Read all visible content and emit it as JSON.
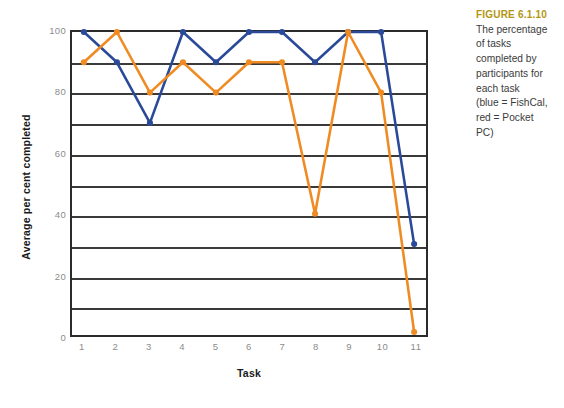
{
  "chart_data": {
    "type": "line",
    "title": "",
    "xlabel": "Task",
    "ylabel": "Average per cent completed",
    "categories": [
      "1",
      "2",
      "3",
      "4",
      "5",
      "6",
      "7",
      "8",
      "9",
      "10",
      "11"
    ],
    "x": [
      1,
      2,
      3,
      4,
      5,
      6,
      7,
      8,
      9,
      10,
      11
    ],
    "xlim": [
      1,
      11
    ],
    "ylim": [
      0,
      100
    ],
    "y_ticks": [
      0,
      20,
      40,
      60,
      80,
      100
    ],
    "y_tick_labels": [
      "0",
      "20",
      "40",
      "60",
      "80",
      "100"
    ],
    "gridlines_y": [
      10,
      20,
      30,
      40,
      50,
      60,
      70,
      80,
      90
    ],
    "grid": true,
    "legend_position": "none",
    "series": [
      {
        "name": "FishCal",
        "color": "#2a4a99",
        "marker": "circle",
        "values": [
          100,
          90,
          70,
          100,
          90,
          100,
          100,
          90,
          100,
          100,
          30
        ]
      },
      {
        "name": "Pocket PC",
        "color": "#ef8b22",
        "marker": "circle",
        "values": [
          90,
          100,
          80,
          90,
          80,
          90,
          90,
          40,
          100,
          80,
          1
        ]
      }
    ]
  },
  "caption": {
    "label": "FIGURE 6.1.10",
    "lines": [
      "The percentage",
      "of tasks",
      "completed by",
      "participants for",
      "each task",
      "(blue = FishCal,",
      "red = Pocket",
      "PC)"
    ]
  },
  "colors": {
    "series_blue": "#2a4a99",
    "series_orange": "#ef8b22",
    "axis": "#2b2b2b",
    "gridline": "#3a3a3a",
    "tick_label": "#8c8c8c",
    "axis_title": "#1a1a1a",
    "caption_label": "#b39612",
    "caption_body": "#3b3b3b",
    "background": "#ffffff"
  }
}
